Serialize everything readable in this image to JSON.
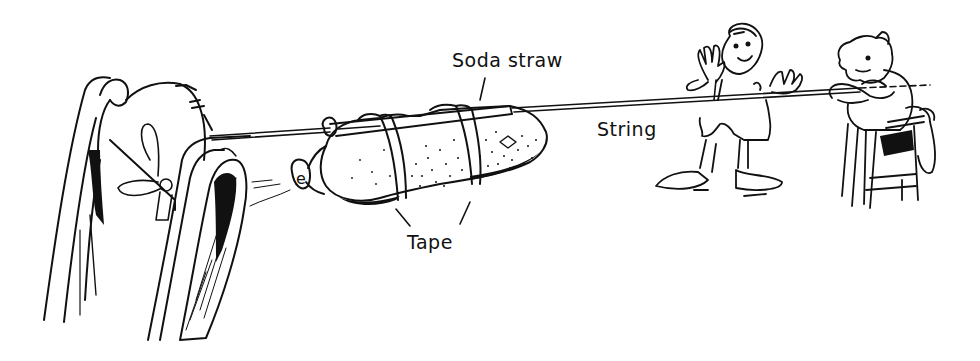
{
  "figure": {
    "colors": {
      "ink": "#111111",
      "background": "#ffffff"
    },
    "labels": {
      "straw": "Soda straw",
      "string": "String",
      "tape": "Tape"
    },
    "parts": [
      {
        "name": "chair-back-left",
        "type": "chair"
      },
      {
        "name": "balloon",
        "type": "balloon"
      },
      {
        "name": "soda-straw",
        "type": "straw"
      },
      {
        "name": "tape-strip",
        "type": "tape",
        "count": 2
      },
      {
        "name": "string",
        "type": "string"
      },
      {
        "name": "waving-child",
        "type": "person"
      },
      {
        "name": "seated-child",
        "type": "person"
      }
    ]
  }
}
